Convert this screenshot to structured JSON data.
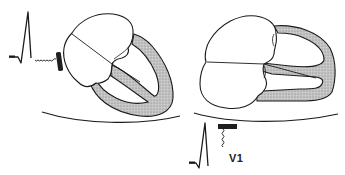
{
  "diagram": {
    "panels": [
      {
        "id": "left",
        "description": "heart viewed with axis tilted toward lateral electrode",
        "electrode": "lateral chest electrode (left side)",
        "waveform": "tall R wave"
      },
      {
        "id": "right",
        "description": "heart rotated with ventricles horizontal",
        "electrode": "V1 electrode below",
        "waveform": "tall R wave recorded at V1"
      }
    ],
    "labels": {
      "lead_v1": "V1"
    },
    "colors": {
      "stroke": "#1a1a1a",
      "myocardium_fill": "#b8b8b8",
      "chamber_fill": "#ffffff",
      "electrode": "#1f1f1f"
    }
  }
}
